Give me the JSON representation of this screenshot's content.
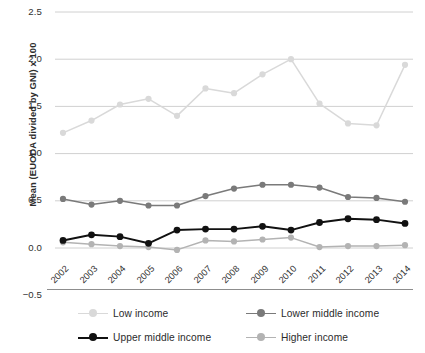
{
  "chart_data": {
    "type": "line",
    "title": "",
    "xlabel": "",
    "ylabel": "Mean (EUODA divided by GNI) x 100",
    "categories": [
      "2002",
      "2003",
      "2004",
      "2005",
      "2006",
      "2007",
      "2008",
      "2009",
      "2010",
      "2011",
      "2012",
      "2013",
      "2014"
    ],
    "x": [
      2002,
      2003,
      2004,
      2005,
      2006,
      2007,
      2008,
      2009,
      2010,
      2011,
      2012,
      2013,
      2014
    ],
    "ylim": [
      -0.5,
      2.5
    ],
    "yticks": [
      2.5,
      2.0,
      1.5,
      1.0,
      0.5,
      0.0,
      -0.5
    ],
    "ytick_labels": [
      "2.5",
      "2.0",
      "1.5",
      "1.0",
      "0.5",
      "0.0",
      "−0.5"
    ],
    "grid": "horizontal",
    "legend_position": "bottom",
    "series": [
      {
        "name": "Low income",
        "color": "#d9d9d9",
        "values": [
          1.22,
          1.35,
          1.52,
          1.58,
          1.4,
          1.69,
          1.64,
          1.84,
          2.0,
          1.53,
          1.32,
          1.3,
          1.94
        ]
      },
      {
        "name": "Lower middle income",
        "color": "#7a7a7a",
        "values": [
          0.52,
          0.46,
          0.5,
          0.45,
          0.45,
          0.55,
          0.63,
          0.67,
          0.67,
          0.64,
          0.54,
          0.53,
          0.49
        ]
      },
      {
        "name": "Upper middle income",
        "color": "#111111",
        "values": [
          0.08,
          0.14,
          0.12,
          0.05,
          0.19,
          0.2,
          0.2,
          0.23,
          0.19,
          0.27,
          0.31,
          0.3,
          0.26
        ]
      },
      {
        "name": "Higher income",
        "color": "#b3b3b3",
        "values": [
          0.06,
          0.04,
          0.02,
          0.01,
          -0.02,
          0.08,
          0.07,
          0.09,
          0.11,
          0.01,
          0.02,
          0.02,
          0.03
        ]
      }
    ]
  },
  "legend": {
    "items": [
      {
        "label": "Low income",
        "color": "#d9d9d9"
      },
      {
        "label": "Lower middle income",
        "color": "#7a7a7a"
      },
      {
        "label": "Upper middle income",
        "color": "#111111"
      },
      {
        "label": "Higher income",
        "color": "#b3b3b3"
      }
    ]
  },
  "colors": {
    "gridline": "#d0d0d0",
    "baseline": "#8d8d8d",
    "text": "#2f2f2f",
    "background": "#ffffff"
  }
}
